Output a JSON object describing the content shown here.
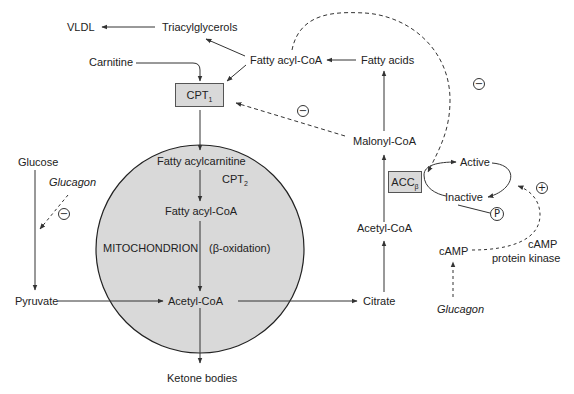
{
  "nodes": {
    "vldl": "VLDL",
    "triacylglycerols": "Triacylglycerols",
    "carnitine": "Carnitine",
    "fatty_acyl_coa_top": "Fatty acyl-CoA",
    "fatty_acids": "Fatty acids",
    "cpt1_main": "CPT",
    "cpt1_sub": "1",
    "malonyl_coa": "Malonyl-CoA",
    "glucose": "Glucose",
    "glucagon_left": "Glucagon",
    "fatty_acylcarnitine": "Fatty acylcarnitine",
    "cpt2_main": "CPT",
    "cpt2_sub": "2",
    "fatty_acyl_coa_mito": "Fatty acyl-CoA",
    "mitochondrion": "MITOCHONDRION",
    "beta_oxidation": "(β-oxidation)",
    "pyruvate": "Pyruvate",
    "acetyl_coa_mito": "Acetyl-CoA",
    "citrate": "Citrate",
    "ketone_bodies": "Ketone bodies",
    "acetyl_coa_cyto": "Acetyl-CoA",
    "acc_main": "ACC",
    "acc_sub": "β",
    "active": "Active",
    "inactive": "Inactive",
    "phosphate": "P",
    "camp": "cAMP",
    "camp_pk_line1": "cAMP",
    "camp_pk_line2": "protein kinase",
    "glucagon_right": "Glucagon"
  },
  "signs": {
    "minus": "−",
    "plus": "+"
  },
  "colors": {
    "mitochondrion_fill": "#d9d9d9",
    "box_fill": "#d9d9d9",
    "line": "#333333"
  }
}
